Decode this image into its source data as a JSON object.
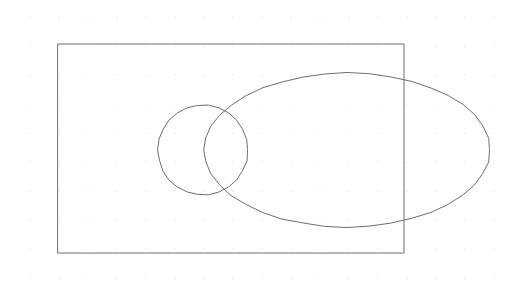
{
  "canvas": {
    "name": "vector-drawing-canvas",
    "width": 522,
    "height": 294,
    "background_color": "#ffffff",
    "stroke_color": "#6e6e72",
    "stroke_width": 1,
    "grid": {
      "visible": true,
      "style": "dots",
      "dot_color": "#d9d9dd",
      "dot_radius": 0.6,
      "spacing_x": 29,
      "spacing_y": 29,
      "origin_x": 30,
      "origin_y": 17,
      "columns": 18,
      "rows": 10
    }
  },
  "chart_data": {
    "type": "diagram",
    "title": "",
    "subtitle": "",
    "xlabel": "",
    "ylabel": "",
    "legend": [],
    "annotations": [],
    "shapes": [
      {
        "id": "shape-rectangle",
        "label": "rectangle",
        "type": "rect",
        "x": 58,
        "y": 44,
        "width": 346,
        "height": 209,
        "fill": "none",
        "stroke": "#6e6e72",
        "stroke_width": 1
      },
      {
        "id": "shape-circle",
        "label": "circle",
        "type": "circle",
        "cx": 203,
        "cy": 150,
        "r": 45,
        "fill": "none",
        "stroke": "#6e6e72",
        "stroke_width": 1
      },
      {
        "id": "shape-ellipse",
        "label": "ellipse",
        "type": "ellipse",
        "cx": 347,
        "cy": 150,
        "rx": 143,
        "ry": 77,
        "fill": "none",
        "stroke": "#6e6e72",
        "stroke_width": 1
      }
    ]
  }
}
